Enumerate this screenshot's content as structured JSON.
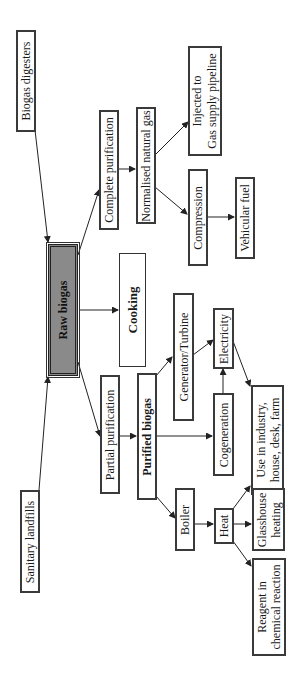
{
  "diagram": {
    "orientation": "rotated 90 degrees counter-clockwise",
    "nodes": {
      "biogas_digesters": "Biogas digesters",
      "sanitary_landfills": "Sanitary landfills",
      "raw_biogas": "Raw biogas",
      "cooking": "Cooking",
      "complete_purification": "Complete purification",
      "partial_purification": "Partial purification",
      "normalised_natural_gas": "Normalised natural gas",
      "purified_biogas": "Purified biogas",
      "injected_pipeline_l1": "Injected to",
      "injected_pipeline_l2": "Gas supply pipeline",
      "compression": "Compression",
      "vehicular_fuel": "Vehicular fuel",
      "generator_turbine": "Generator/Turbine",
      "electricity": "Electricity",
      "cogeneration": "Cogeneration",
      "use_industry_l1": "Use in industry,",
      "use_industry_l2": "house, desk, farm",
      "boiler": "Boiler",
      "heat": "Heat",
      "glasshouse_l1": "Glasshouse",
      "glasshouse_l2": "heating",
      "reagent_l1": "Reagent in",
      "reagent_l2": "chemical reaction"
    },
    "edges": [
      [
        "Biogas digesters",
        "Raw biogas"
      ],
      [
        "Sanitary landfills",
        "Raw biogas"
      ],
      [
        "Raw biogas",
        "Cooking"
      ],
      [
        "Raw biogas",
        "Complete purification"
      ],
      [
        "Raw biogas",
        "Partial purification"
      ],
      [
        "Complete purification",
        "Normalised natural gas"
      ],
      [
        "Normalised natural gas",
        "Injected to Gas supply pipeline"
      ],
      [
        "Normalised natural gas",
        "Compression"
      ],
      [
        "Compression",
        "Vehicular fuel"
      ],
      [
        "Partial purification",
        "Purified biogas"
      ],
      [
        "Purified biogas",
        "Generator/Turbine"
      ],
      [
        "Purified biogas",
        "Cogeneration"
      ],
      [
        "Purified biogas",
        "Boiler"
      ],
      [
        "Generator/Turbine",
        "Electricity"
      ],
      [
        "Cogeneration",
        "Electricity"
      ],
      [
        "Electricity",
        "Use in industry, house, desk, farm"
      ],
      [
        "Boiler",
        "Heat"
      ],
      [
        "Heat",
        "Use in industry, house, desk, farm"
      ],
      [
        "Heat",
        "Glasshouse heating"
      ],
      [
        "Heat",
        "Reagent in chemical reaction"
      ]
    ]
  }
}
